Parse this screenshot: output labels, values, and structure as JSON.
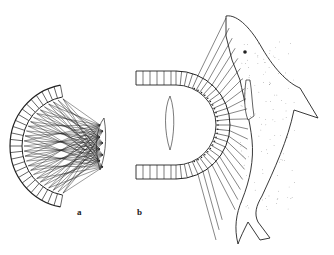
{
  "figure": {
    "panels": [
      {
        "label": "a",
        "description": "Semicircular array with crossing rays from a small dolphin"
      },
      {
        "label": "b",
        "description": "Semicircular array with rays projecting to a large dolphin"
      }
    ],
    "colors": {
      "ink": "#222222",
      "background": "#ffffff"
    }
  }
}
